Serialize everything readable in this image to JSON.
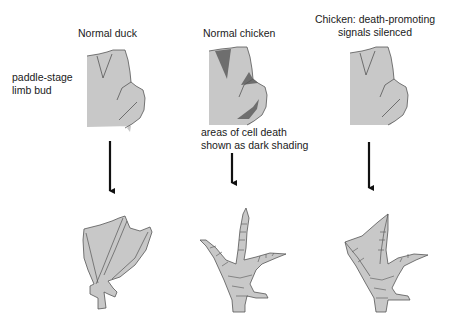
{
  "columns": [
    {
      "title": "Normal duck"
    },
    {
      "title": "Normal chicken"
    },
    {
      "title_line1": "Chicken: death-promoting",
      "title_line2": "signals silenced"
    }
  ],
  "side_label": {
    "line1": "paddle-stage",
    "line2": "limb bud"
  },
  "annotation": {
    "line1": "areas of cell death",
    "line2": "shown as dark shading"
  },
  "colors": {
    "tissue": "#c8c8c8",
    "outline": "#555555",
    "cell_death": "#6e6e6e",
    "arrow": "#111111"
  }
}
